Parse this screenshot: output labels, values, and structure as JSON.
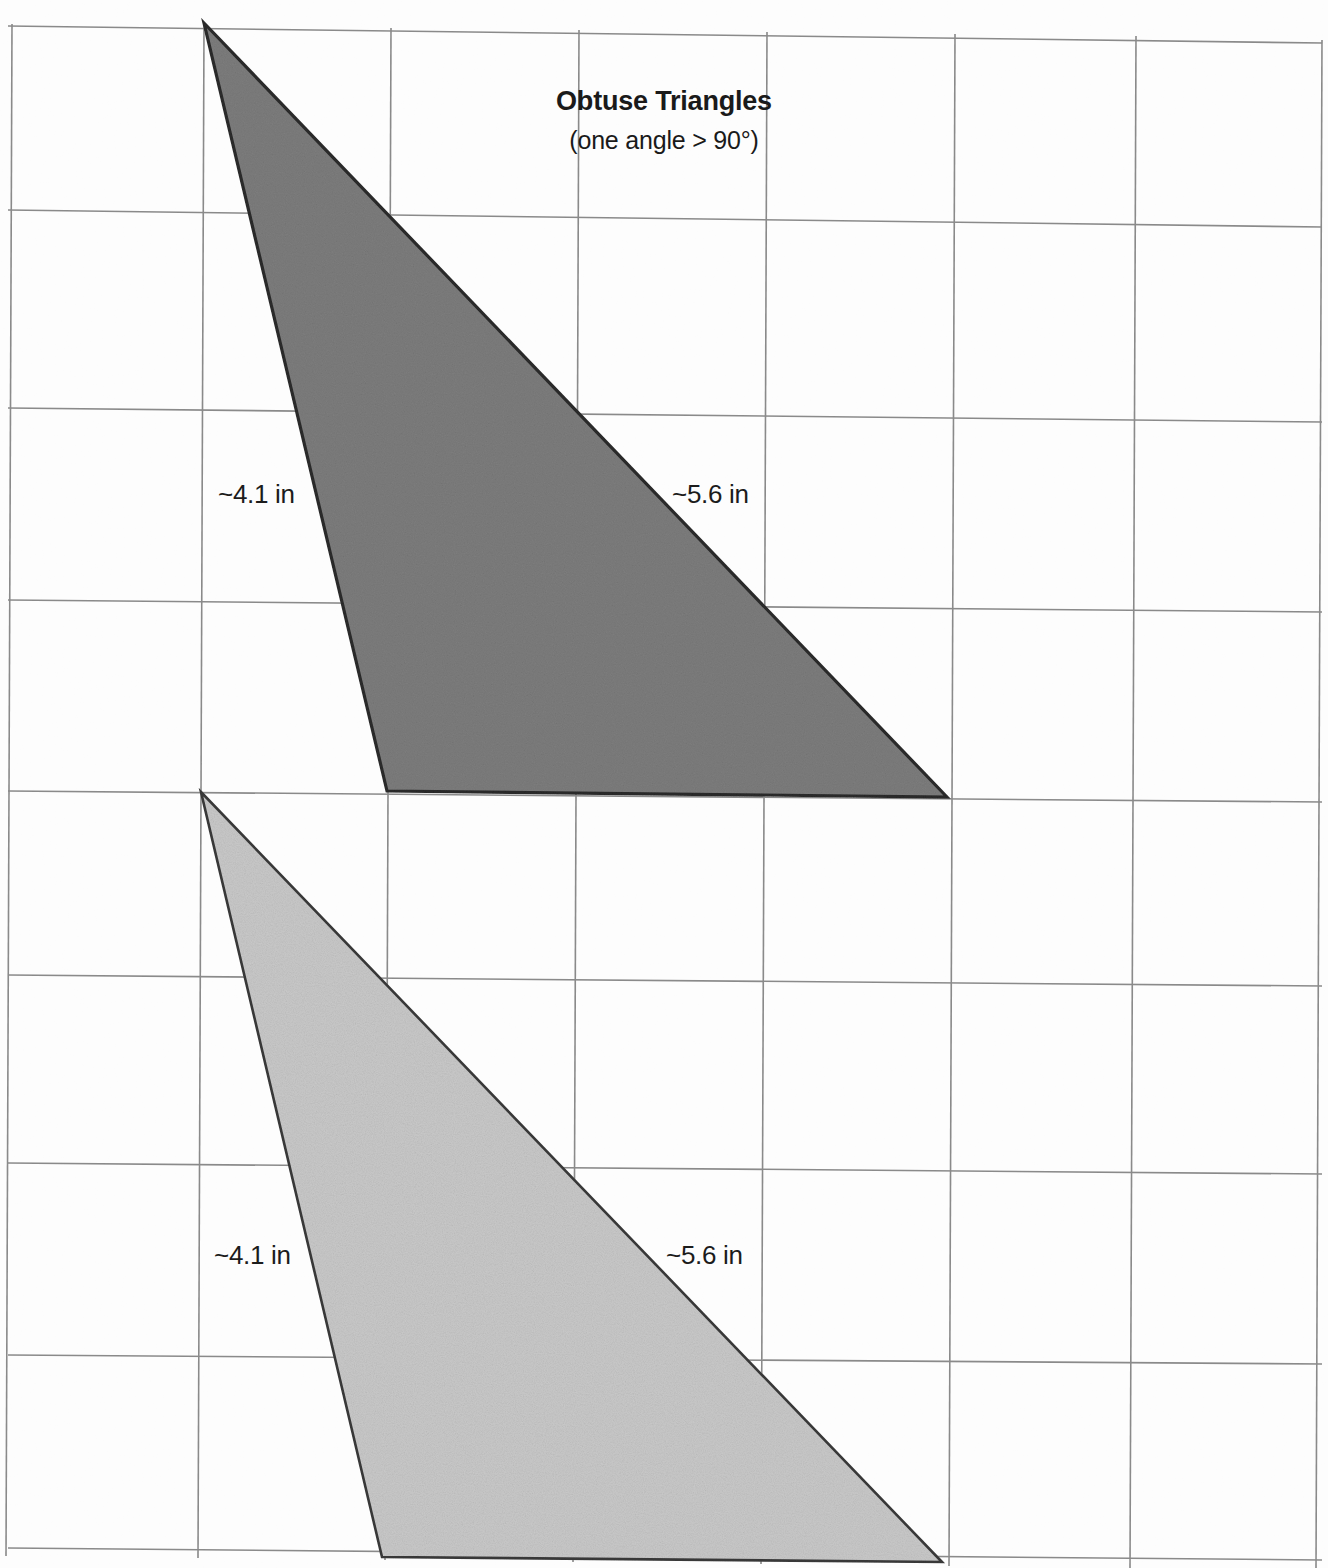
{
  "page": {
    "background_color": "#fdfdfd",
    "width": 1328,
    "height": 1568
  },
  "title": {
    "main": "Obtuse Triangles",
    "subtitle": "(one angle > 90°)"
  },
  "grid": {
    "line_color": "#8a8a8a",
    "border_color": "#6e6e6e",
    "vertical_x": [
      10,
      203,
      390,
      578,
      766,
      953,
      1134,
      1320
    ],
    "horizontal_y": [
      26,
      210,
      408,
      600,
      793,
      975,
      1165,
      1357,
      1566
    ],
    "skew_note": "scanned page, lines slightly rotated"
  },
  "figures": [
    {
      "name": "obtuse-triangle-dark",
      "fill": "#7d7d7d",
      "stroke": "#2b2b2b",
      "vertices": [
        [
          204,
          23
        ],
        [
          947,
          797
        ],
        [
          387,
          791
        ]
      ],
      "labels": {
        "left_side": "~4.1 in",
        "right_side": "~5.6 in"
      }
    },
    {
      "name": "obtuse-triangle-light",
      "fill": "#c9c9c9",
      "stroke": "#3a3a3a",
      "vertices": [
        [
          201,
          792
        ],
        [
          942,
          1562
        ],
        [
          382,
          1557
        ]
      ],
      "labels": {
        "left_side": "~4.1 in",
        "right_side": "~5.6 in"
      }
    }
  ],
  "chart_data": {
    "type": "diagram",
    "title": "Obtuse Triangles",
    "subtitle": "(one angle > 90°)",
    "shapes": [
      {
        "shape": "triangle",
        "classification": "obtuse",
        "shade": "dark gray",
        "side_labels": [
          "~4.1 in",
          "~5.6 in"
        ],
        "vertices": [
          [
            204,
            23
          ],
          [
            947,
            797
          ],
          [
            387,
            791
          ]
        ]
      },
      {
        "shape": "triangle",
        "classification": "obtuse",
        "shade": "light gray",
        "side_labels": [
          "~4.1 in",
          "~5.6 in"
        ],
        "vertices": [
          [
            201,
            792
          ],
          [
            942,
            1562
          ],
          [
            382,
            1557
          ]
        ]
      }
    ],
    "grid": {
      "columns": 7,
      "rows": 8,
      "cell_width_px": 189,
      "cell_height_px": 192
    }
  }
}
